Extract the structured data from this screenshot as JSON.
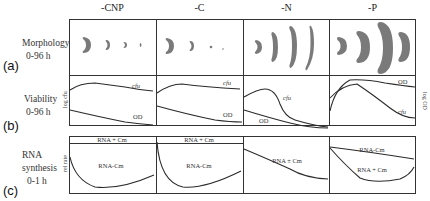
{
  "columns": [
    {
      "label": "-CNP"
    },
    {
      "label": "-C"
    },
    {
      "label": "-N"
    },
    {
      "label": "-P"
    }
  ],
  "rows": [
    {
      "letter": "(a)",
      "title": "Morphology",
      "subtitle": "0-96 h"
    },
    {
      "letter": "(b)",
      "title": "Viability",
      "subtitle": "0-96 h",
      "y_axis_left": "log cfu",
      "y_axis_right": "log OD"
    },
    {
      "letter": "(c)",
      "title_line1": "RNA",
      "title_line2": "synthesis",
      "subtitle": "0-1 h",
      "y_axis_left": "rel rate"
    }
  ],
  "viability_labels": {
    "cfu": "cfu",
    "od": "OD"
  },
  "rna_labels": {
    "plus_cm": "RNA + Cm",
    "minus_cm": "RNA-Cm",
    "pm_cm": "RNA ± Cm"
  },
  "colors": {
    "line": "#2a2a2a",
    "cell_fill": "#7a7a7a",
    "border": "#333333"
  }
}
